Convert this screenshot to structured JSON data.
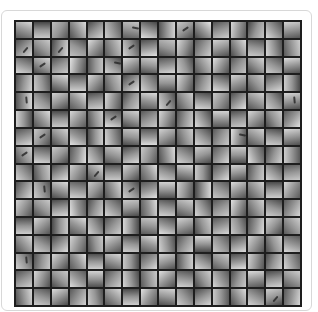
{
  "figure": {
    "rows": 16,
    "cols": 16,
    "colors": {
      "background": "#ffffff",
      "frame_border": "#d8d8d8",
      "grid_lines": "#1e1e1e",
      "patch_mid": "#9a9a9a"
    },
    "cells": [
      [
        20,
        215,
        90,
        0
      ],
      [
        180,
        200,
        70,
        0
      ],
      [
        300,
        190,
        85,
        0
      ],
      [
        60,
        220,
        80,
        0
      ],
      [
        140,
        210,
        75,
        0
      ],
      [
        250,
        205,
        90,
        0
      ],
      [
        10,
        195,
        95,
        2
      ],
      [
        200,
        225,
        70,
        0
      ],
      [
        90,
        210,
        85,
        0
      ],
      [
        320,
        200,
        80,
        1
      ],
      [
        45,
        230,
        75,
        0
      ],
      [
        160,
        205,
        85,
        0
      ],
      [
        280,
        215,
        90,
        0
      ],
      [
        110,
        200,
        70,
        0
      ],
      [
        230,
        220,
        80,
        0
      ],
      [
        350,
        210,
        85,
        0
      ],
      [
        135,
        210,
        80,
        3
      ],
      [
        40,
        200,
        85,
        0
      ],
      [
        100,
        215,
        75,
        3
      ],
      [
        210,
        190,
        80,
        0
      ],
      [
        310,
        220,
        85,
        0
      ],
      [
        70,
        205,
        90,
        0
      ],
      [
        250,
        210,
        75,
        1
      ],
      [
        170,
        225,
        80,
        0
      ],
      [
        20,
        195,
        85,
        0
      ],
      [
        290,
        215,
        75,
        0
      ],
      [
        120,
        205,
        90,
        0
      ],
      [
        340,
        210,
        80,
        0
      ],
      [
        60,
        220,
        75,
        0
      ],
      [
        190,
        200,
        85,
        0
      ],
      [
        260,
        215,
        80,
        0
      ],
      [
        80,
        205,
        90,
        0
      ],
      [
        200,
        215,
        85,
        0
      ],
      [
        30,
        210,
        75,
        1
      ],
      [
        150,
        200,
        85,
        0
      ],
      [
        280,
        225,
        80,
        0
      ],
      [
        90,
        195,
        90,
        0
      ],
      [
        220,
        210,
        75,
        2
      ],
      [
        330,
        220,
        85,
        0
      ],
      [
        10,
        205,
        80,
        0
      ],
      [
        170,
        215,
        90,
        0
      ],
      [
        250,
        200,
        75,
        0
      ],
      [
        60,
        210,
        85,
        0
      ],
      [
        300,
        225,
        80,
        0
      ],
      [
        130,
        195,
        90,
        0
      ],
      [
        40,
        215,
        75,
        0
      ],
      [
        210,
        205,
        85,
        0
      ],
      [
        350,
        220,
        80,
        0
      ],
      [
        100,
        210,
        80,
        0
      ],
      [
        260,
        200,
        85,
        0
      ],
      [
        20,
        220,
        75,
        0
      ],
      [
        180,
        205,
        90,
        0
      ],
      [
        310,
        215,
        80,
        0
      ],
      [
        70,
        200,
        85,
        0
      ],
      [
        140,
        225,
        75,
        1
      ],
      [
        230,
        210,
        90,
        0
      ],
      [
        0,
        195,
        85,
        0
      ],
      [
        290,
        215,
        80,
        0
      ],
      [
        110,
        205,
        85,
        0
      ],
      [
        200,
        220,
        75,
        0
      ],
      [
        340,
        210,
        90,
        0
      ],
      [
        50,
        200,
        80,
        0
      ],
      [
        160,
        215,
        85,
        0
      ],
      [
        270,
        205,
        75,
        0
      ],
      [
        90,
        215,
        85,
        4
      ],
      [
        220,
        200,
        80,
        0
      ],
      [
        330,
        210,
        75,
        0
      ],
      [
        40,
        225,
        90,
        0
      ],
      [
        170,
        205,
        80,
        0
      ],
      [
        280,
        215,
        85,
        0
      ],
      [
        120,
        200,
        75,
        0
      ],
      [
        10,
        220,
        90,
        0
      ],
      [
        250,
        210,
        80,
        3
      ],
      [
        60,
        205,
        85,
        0
      ],
      [
        190,
        215,
        75,
        0
      ],
      [
        300,
        200,
        90,
        0
      ],
      [
        140,
        225,
        80,
        0
      ],
      [
        30,
        210,
        85,
        0
      ],
      [
        230,
        205,
        75,
        0
      ],
      [
        350,
        215,
        80,
        4
      ],
      [
        270,
        210,
        80,
        0
      ],
      [
        50,
        220,
        85,
        0
      ],
      [
        180,
        200,
        75,
        0
      ],
      [
        310,
        215,
        90,
        0
      ],
      [
        80,
        205,
        80,
        0
      ],
      [
        200,
        225,
        85,
        1
      ],
      [
        20,
        210,
        75,
        0
      ],
      [
        150,
        200,
        90,
        0
      ],
      [
        290,
        215,
        80,
        0
      ],
      [
        100,
        205,
        85,
        0
      ],
      [
        240,
        220,
        75,
        0
      ],
      [
        0,
        210,
        90,
        0
      ],
      [
        170,
        200,
        80,
        0
      ],
      [
        320,
        215,
        85,
        0
      ],
      [
        60,
        205,
        75,
        0
      ],
      [
        130,
        225,
        90,
        0
      ],
      [
        160,
        215,
        85,
        0
      ],
      [
        300,
        200,
        80,
        1
      ],
      [
        40,
        210,
        75,
        0
      ],
      [
        210,
        225,
        90,
        0
      ],
      [
        90,
        205,
        80,
        0
      ],
      [
        260,
        215,
        85,
        0
      ],
      [
        10,
        200,
        75,
        0
      ],
      [
        180,
        220,
        90,
        0
      ],
      [
        330,
        210,
        80,
        0
      ],
      [
        70,
        205,
        85,
        0
      ],
      [
        220,
        215,
        75,
        0
      ],
      [
        120,
        200,
        90,
        0
      ],
      [
        280,
        225,
        80,
        2
      ],
      [
        30,
        210,
        85,
        0
      ],
      [
        190,
        205,
        75,
        0
      ],
      [
        350,
        215,
        80,
        0
      ],
      [
        60,
        205,
        80,
        1
      ],
      [
        190,
        215,
        85,
        0
      ],
      [
        320,
        200,
        75,
        0
      ],
      [
        100,
        225,
        90,
        0
      ],
      [
        240,
        210,
        80,
        0
      ],
      [
        20,
        205,
        85,
        0
      ],
      [
        160,
        215,
        75,
        0
      ],
      [
        290,
        200,
        90,
        0
      ],
      [
        80,
        220,
        80,
        0
      ],
      [
        210,
        210,
        85,
        0
      ],
      [
        340,
        205,
        75,
        0
      ],
      [
        130,
        215,
        90,
        0
      ],
      [
        0,
        200,
        80,
        0
      ],
      [
        250,
        225,
        85,
        0
      ],
      [
        110,
        210,
        75,
        0
      ],
      [
        270,
        205,
        90,
        0
      ],
      [
        230,
        210,
        85,
        0
      ],
      [
        80,
        200,
        80,
        0
      ],
      [
        150,
        220,
        75,
        0
      ],
      [
        300,
        205,
        90,
        0
      ],
      [
        40,
        215,
        80,
        3
      ],
      [
        180,
        200,
        85,
        0
      ],
      [
        320,
        210,
        75,
        0
      ],
      [
        60,
        225,
        90,
        0
      ],
      [
        200,
        205,
        80,
        0
      ],
      [
        10,
        215,
        85,
        0
      ],
      [
        270,
        200,
        75,
        0
      ],
      [
        140,
        220,
        90,
        0
      ],
      [
        350,
        210,
        80,
        0
      ],
      [
        100,
        205,
        85,
        0
      ],
      [
        220,
        215,
        75,
        0
      ],
      [
        170,
        200,
        90,
        0
      ],
      [
        120,
        215,
        80,
        0
      ],
      [
        250,
        205,
        85,
        4
      ],
      [
        20,
        220,
        75,
        0
      ],
      [
        190,
        210,
        90,
        0
      ],
      [
        310,
        200,
        80,
        0
      ],
      [
        70,
        215,
        85,
        0
      ],
      [
        230,
        205,
        75,
        1
      ],
      [
        160,
        225,
        90,
        0
      ],
      [
        0,
        210,
        80,
        0
      ],
      [
        280,
        205,
        85,
        0
      ],
      [
        90,
        215,
        75,
        0
      ],
      [
        210,
        200,
        90,
        0
      ],
      [
        330,
        220,
        80,
        0
      ],
      [
        50,
        210,
        85,
        0
      ],
      [
        180,
        205,
        75,
        0
      ],
      [
        300,
        215,
        90,
        0
      ],
      [
        300,
        210,
        85,
        0
      ],
      [
        40,
        200,
        80,
        0
      ],
      [
        170,
        215,
        75,
        0
      ],
      [
        260,
        225,
        90,
        0
      ],
      [
        110,
        205,
        80,
        0
      ],
      [
        220,
        215,
        85,
        0
      ],
      [
        350,
        200,
        75,
        0
      ],
      [
        80,
        220,
        90,
        0
      ],
      [
        190,
        210,
        80,
        0
      ],
      [
        20,
        205,
        85,
        0
      ],
      [
        240,
        215,
        75,
        0
      ],
      [
        150,
        200,
        90,
        0
      ],
      [
        290,
        225,
        80,
        0
      ],
      [
        60,
        210,
        85,
        0
      ],
      [
        200,
        205,
        75,
        0
      ],
      [
        120,
        215,
        90,
        0
      ],
      [
        180,
        205,
        80,
        0
      ],
      [
        320,
        215,
        85,
        0
      ],
      [
        90,
        200,
        75,
        0
      ],
      [
        30,
        220,
        90,
        0
      ],
      [
        240,
        210,
        80,
        0
      ],
      [
        130,
        205,
        85,
        0
      ],
      [
        270,
        215,
        75,
        0
      ],
      [
        10,
        200,
        90,
        0
      ],
      [
        200,
        225,
        80,
        0
      ],
      [
        340,
        210,
        85,
        0
      ],
      [
        70,
        205,
        75,
        0
      ],
      [
        160,
        215,
        90,
        0
      ],
      [
        250,
        200,
        80,
        0
      ],
      [
        100,
        220,
        85,
        0
      ],
      [
        310,
        210,
        75,
        0
      ],
      [
        50,
        205,
        90,
        0
      ],
      [
        50,
        215,
        85,
        0
      ],
      [
        210,
        205,
        80,
        0
      ],
      [
        140,
        220,
        75,
        0
      ],
      [
        290,
        210,
        90,
        0
      ],
      [
        80,
        200,
        80,
        0
      ],
      [
        330,
        215,
        85,
        0
      ],
      [
        190,
        205,
        75,
        0
      ],
      [
        20,
        225,
        90,
        0
      ],
      [
        260,
        210,
        80,
        0
      ],
      [
        120,
        205,
        85,
        0
      ],
      [
        0,
        215,
        75,
        0
      ],
      [
        230,
        200,
        90,
        0
      ],
      [
        160,
        220,
        80,
        0
      ],
      [
        300,
        210,
        85,
        0
      ],
      [
        70,
        205,
        75,
        0
      ],
      [
        200,
        215,
        90,
        0
      ],
      [
        240,
        210,
        80,
        4
      ],
      [
        100,
        200,
        85,
        0
      ],
      [
        310,
        215,
        75,
        0
      ],
      [
        60,
        225,
        90,
        0
      ],
      [
        180,
        205,
        80,
        0
      ],
      [
        20,
        215,
        85,
        0
      ],
      [
        270,
        200,
        75,
        0
      ],
      [
        140,
        220,
        90,
        0
      ],
      [
        340,
        210,
        80,
        0
      ],
      [
        90,
        205,
        85,
        0
      ],
      [
        210,
        215,
        75,
        0
      ],
      [
        30,
        200,
        90,
        0
      ],
      [
        170,
        225,
        80,
        0
      ],
      [
        280,
        210,
        85,
        0
      ],
      [
        110,
        205,
        75,
        0
      ],
      [
        250,
        215,
        90,
        0
      ],
      [
        150,
        205,
        85,
        0
      ],
      [
        290,
        215,
        80,
        0
      ],
      [
        40,
        200,
        75,
        0
      ],
      [
        220,
        220,
        90,
        0
      ],
      [
        0,
        210,
        80,
        0
      ],
      [
        130,
        205,
        85,
        0
      ],
      [
        260,
        215,
        75,
        0
      ],
      [
        80,
        200,
        90,
        0
      ],
      [
        320,
        225,
        80,
        0
      ],
      [
        190,
        210,
        85,
        0
      ],
      [
        60,
        205,
        75,
        0
      ],
      [
        240,
        215,
        90,
        0
      ],
      [
        110,
        200,
        80,
        0
      ],
      [
        350,
        220,
        85,
        0
      ],
      [
        170,
        210,
        75,
        0
      ],
      [
        30,
        205,
        90,
        0
      ],
      [
        80,
        215,
        80,
        0
      ],
      [
        200,
        205,
        85,
        0
      ],
      [
        330,
        220,
        75,
        0
      ],
      [
        120,
        210,
        90,
        0
      ],
      [
        260,
        200,
        80,
        0
      ],
      [
        40,
        215,
        85,
        0
      ],
      [
        180,
        205,
        75,
        0
      ],
      [
        300,
        225,
        90,
        0
      ],
      [
        10,
        210,
        80,
        0
      ],
      [
        230,
        205,
        85,
        0
      ],
      [
        150,
        215,
        75,
        0
      ],
      [
        270,
        200,
        90,
        0
      ],
      [
        60,
        220,
        80,
        0
      ],
      [
        210,
        210,
        85,
        0
      ],
      [
        340,
        205,
        75,
        3
      ],
      [
        100,
        215,
        90,
        0
      ]
    ]
  }
}
